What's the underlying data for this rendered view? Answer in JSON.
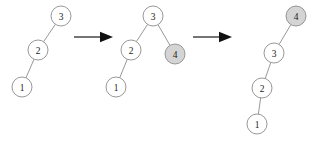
{
  "figure": {
    "background_color": "#ffffff",
    "node_stroke_color": "#8c8c8c",
    "node_fill_default": "#ffffff",
    "node_fill_highlight": "#d4d4d4",
    "label_color": "#1a1a1a",
    "arrow_color": "#111111",
    "node_radius": 10
  },
  "trees": [
    {
      "id": "tree-1",
      "name": "initial-tree",
      "nodes": [
        {
          "id": "t1-n3",
          "label": "3",
          "x": 61,
          "y": 16,
          "fill": "white"
        },
        {
          "id": "t1-n2",
          "label": "2",
          "x": 38,
          "y": 50,
          "fill": "white"
        },
        {
          "id": "t1-n1",
          "label": "1",
          "x": 22,
          "y": 87,
          "fill": "white"
        }
      ],
      "edges": [
        {
          "from": "t1-n3",
          "to": "t1-n2"
        },
        {
          "from": "t1-n2",
          "to": "t1-n1"
        }
      ]
    },
    {
      "id": "tree-2",
      "name": "tree-after-inserting-4",
      "nodes": [
        {
          "id": "t2-n3",
          "label": "3",
          "x": 153,
          "y": 16,
          "fill": "white"
        },
        {
          "id": "t2-n2",
          "label": "2",
          "x": 131,
          "y": 50,
          "fill": "white"
        },
        {
          "id": "t2-n4",
          "label": "4",
          "x": 175,
          "y": 54,
          "fill": "gray"
        },
        {
          "id": "t2-n1",
          "label": "1",
          "x": 116,
          "y": 87,
          "fill": "white"
        }
      ],
      "edges": [
        {
          "from": "t2-n3",
          "to": "t2-n2"
        },
        {
          "from": "t2-n3",
          "to": "t2-n4"
        },
        {
          "from": "t2-n2",
          "to": "t2-n1"
        }
      ]
    },
    {
      "id": "tree-3",
      "name": "final-right-spine-tree",
      "nodes": [
        {
          "id": "t3-n4",
          "label": "4",
          "x": 296,
          "y": 16,
          "fill": "gray"
        },
        {
          "id": "t3-n3",
          "label": "3",
          "x": 274,
          "y": 53,
          "fill": "white"
        },
        {
          "id": "t3-n2",
          "label": "2",
          "x": 262,
          "y": 88,
          "fill": "white"
        },
        {
          "id": "t3-n1",
          "label": "1",
          "x": 257,
          "y": 124,
          "fill": "white"
        }
      ],
      "edges": [
        {
          "from": "t3-n4",
          "to": "t3-n3"
        },
        {
          "from": "t3-n3",
          "to": "t3-n2"
        },
        {
          "from": "t3-n2",
          "to": "t3-n1"
        }
      ]
    }
  ],
  "arrows": [
    {
      "id": "arrow-1",
      "name": "transition-arrow-1",
      "x1": 74,
      "x2": 113,
      "y": 37
    },
    {
      "id": "arrow-2",
      "name": "transition-arrow-2",
      "x1": 193,
      "x2": 232,
      "y": 37
    }
  ]
}
